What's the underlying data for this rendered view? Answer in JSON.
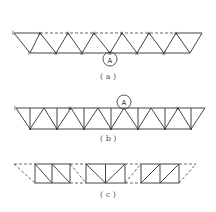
{
  "figure": {
    "panels": [
      {
        "id": "a",
        "caption": "( a )",
        "highlight_label": "A",
        "description": "Warren truss with pinned joints marked, top chord partly dashed"
      },
      {
        "id": "b",
        "caption": "( b )",
        "highlight_label": "A",
        "description": "Warren truss with verticals, node A circled on top chord"
      },
      {
        "id": "c",
        "caption": "( c )",
        "highlight_label": "",
        "description": "Three separate truss segments joined by dashed connections"
      }
    ],
    "joint_marker": "x",
    "end_marker": "I"
  }
}
